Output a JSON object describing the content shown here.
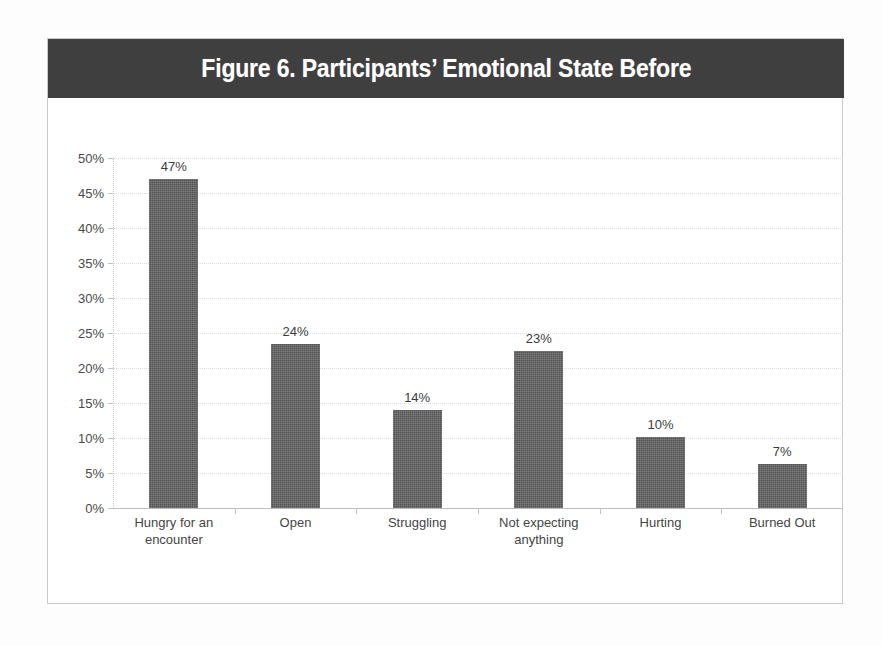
{
  "figure": {
    "title": "Figure 6. Participants’ Emotional State Before",
    "title_bar_color": "#3f3f3f",
    "title_text_color": "#ffffff",
    "frame_border_color": "#c9c9c9",
    "background_color": "#ffffff"
  },
  "chart_data": {
    "type": "bar",
    "title": "Figure 6. Participants’ Emotional State Before",
    "xlabel": "",
    "ylabel": "",
    "categories": [
      "Hungry for an encounter",
      "Open",
      "Struggling",
      "Not expecting anything",
      "Hurting",
      "Burned Out"
    ],
    "category_lines": [
      [
        "Hungry for an",
        "encounter"
      ],
      [
        "Open"
      ],
      [
        "Struggling"
      ],
      [
        "Not expecting",
        "anything"
      ],
      [
        "Hurting"
      ],
      [
        "Burned Out"
      ]
    ],
    "values": [
      47,
      23.4,
      14,
      22.4,
      10.1,
      6.3
    ],
    "data_labels": [
      "47%",
      "24%",
      "14%",
      "23%",
      "10%",
      "7%"
    ],
    "ylim": [
      0,
      50
    ],
    "ytick_values": [
      0,
      5,
      10,
      15,
      20,
      25,
      30,
      35,
      40,
      45,
      50
    ],
    "ytick_labels": [
      "0%",
      "5%",
      "10%",
      "15%",
      "20%",
      "25%",
      "30%",
      "35%",
      "40%",
      "45%",
      "50%"
    ],
    "grid": true,
    "legend": false,
    "bar_color": "#5e5e5e",
    "gridline_color": "#dcdcdc",
    "axis_color": "#bdbdbd"
  }
}
